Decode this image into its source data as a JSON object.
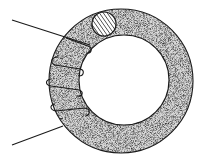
{
  "diagram": {
    "title": "Toroidal coil",
    "core": {
      "shape": "torus",
      "fill": "stippled grey",
      "fill_color": "#bdbdbd",
      "outline_color": "#1a1a1a"
    },
    "cross_section": {
      "position": "top",
      "pattern": "diagonal hatching"
    },
    "winding": {
      "turns": 4,
      "lead_in": "upper-left",
      "lead_out": "lower-left",
      "wire_color": "#1a1a1a"
    },
    "background_color": "#ffffff"
  }
}
